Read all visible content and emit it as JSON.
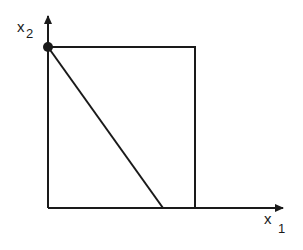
{
  "diagram": {
    "axes": {
      "x_label": {
        "base": "x",
        "subscript": "1"
      },
      "y_label": {
        "base": "x",
        "subscript": "2"
      }
    },
    "elements": [
      "x1-axis-arrow",
      "x2-axis-arrow",
      "rectangle-box",
      "diagonal-line",
      "marked-point-on-x2-axis"
    ],
    "colors": {
      "stroke": "#1a1a1a",
      "background": "#ffffff"
    }
  }
}
